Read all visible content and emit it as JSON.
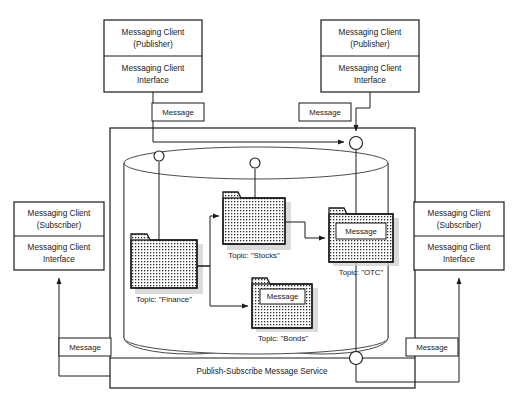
{
  "diagram": {
    "title": "Publish-Subscribe Message Service",
    "service_label": "Publish-Subscribe Message Service",
    "colors": {
      "stroke": "#1a1a1a",
      "background": "#ffffff",
      "shadow": "#cfcfcf",
      "cylinder_stroke": "#4a4a4a"
    }
  },
  "clients": {
    "publisher_left": {
      "top_line1": "Messaging Client",
      "top_line2": "(Publisher)",
      "bottom_line1": "Messaging Client",
      "bottom_line2": "Interface"
    },
    "publisher_right": {
      "top_line1": "Messaging Client",
      "top_line2": "(Publisher)",
      "bottom_line1": "Messaging Client",
      "bottom_line2": "Interface"
    },
    "subscriber_left": {
      "top_line1": "Messaging Client",
      "top_line2": "(Subscriber)",
      "bottom_line1": "Messaging Client",
      "bottom_line2": "Interface"
    },
    "subscriber_right": {
      "top_line1": "Messaging Client",
      "top_line2": "(Subscriber)",
      "bottom_line1": "Messaging Client",
      "bottom_line2": "Interface"
    }
  },
  "messages": {
    "publisher_left_message": "Message",
    "publisher_right_message": "Message",
    "subscriber_left_message": "Message",
    "subscriber_right_message": "Message",
    "bonds_message": "Message",
    "otc_message": "Message"
  },
  "topics": [
    {
      "id": "finance",
      "label": "Topic: \"Finance\"",
      "has_message": false
    },
    {
      "id": "stocks",
      "label": "Topic: \"Stocks\"",
      "has_message": false
    },
    {
      "id": "bonds",
      "label": "Topic: \"Bonds\"",
      "has_message": true,
      "message": "Message"
    },
    {
      "id": "otc",
      "label": "Topic: \"OTC\"",
      "has_message": true,
      "message": "Message"
    }
  ]
}
